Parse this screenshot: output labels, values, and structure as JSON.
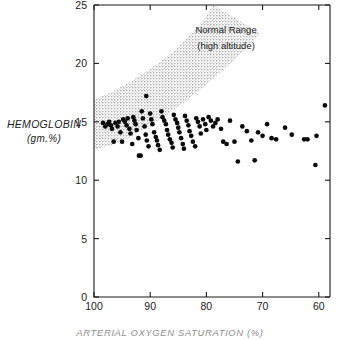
{
  "figure": {
    "title": "",
    "background": "#ffffff",
    "ink_color": "#111111"
  },
  "chart_data": {
    "type": "scatter",
    "title": "",
    "subtitle": "",
    "xlabel": "ARTERIAL OXYGEN SATURATION (%)",
    "ylabel": "HEMOGLOBIN",
    "ylabel_unit": "(gm.%)",
    "xlim": [
      100,
      58
    ],
    "ylim": [
      0,
      25
    ],
    "x_inverted": true,
    "xticks": [
      100,
      90,
      80,
      70,
      60
    ],
    "xticklabels": [
      "100",
      "90",
      "80",
      "70",
      "60"
    ],
    "yticks": [
      0,
      5,
      10,
      15,
      20,
      25
    ],
    "yticklabels": [
      "0",
      "5",
      "10",
      "15",
      "20",
      "25"
    ],
    "grid": false,
    "legend_position": "inside-top-right",
    "annotations": [
      {
        "name": "normal-range-label-line1",
        "text": "Normal Range",
        "x": 76.5,
        "y": 22.6
      },
      {
        "name": "normal-range-label-line2",
        "text": "(high altitude)",
        "x": 76.5,
        "y": 21.2
      }
    ],
    "bands": [
      {
        "name": "Normal Range (high altitude)",
        "fill": "#d2d2d2",
        "style": "stippled",
        "lower": [
          {
            "x": 100.0,
            "y": 12.6
          },
          {
            "x": 97.0,
            "y": 13.0
          },
          {
            "x": 94.0,
            "y": 13.6
          },
          {
            "x": 91.0,
            "y": 14.4
          },
          {
            "x": 88.0,
            "y": 15.3
          },
          {
            "x": 85.0,
            "y": 16.3
          },
          {
            "x": 82.0,
            "y": 17.4
          },
          {
            "x": 79.0,
            "y": 18.6
          },
          {
            "x": 76.0,
            "y": 19.9
          },
          {
            "x": 73.0,
            "y": 21.3
          },
          {
            "x": 70.5,
            "y": 22.6
          }
        ],
        "upper": [
          {
            "x": 100.0,
            "y": 16.9
          },
          {
            "x": 97.0,
            "y": 17.5
          },
          {
            "x": 94.0,
            "y": 18.3
          },
          {
            "x": 91.0,
            "y": 19.2
          },
          {
            "x": 88.0,
            "y": 20.2
          },
          {
            "x": 85.0,
            "y": 21.4
          },
          {
            "x": 82.5,
            "y": 22.6
          },
          {
            "x": 80.5,
            "y": 23.7
          },
          {
            "x": 78.8,
            "y": 25.0
          }
        ]
      }
    ],
    "series": [
      {
        "name": "patients",
        "marker": "filled-circle",
        "color": "#0a0a0a",
        "points": [
          {
            "x": 98.4,
            "y": 14.9
          },
          {
            "x": 98.0,
            "y": 14.6
          },
          {
            "x": 97.6,
            "y": 14.8
          },
          {
            "x": 97.3,
            "y": 15.0
          },
          {
            "x": 97.0,
            "y": 14.7
          },
          {
            "x": 96.8,
            "y": 14.4
          },
          {
            "x": 96.5,
            "y": 13.3
          },
          {
            "x": 96.2,
            "y": 14.9
          },
          {
            "x": 95.8,
            "y": 14.6
          },
          {
            "x": 95.6,
            "y": 15.0
          },
          {
            "x": 95.3,
            "y": 14.1
          },
          {
            "x": 95.0,
            "y": 13.3
          },
          {
            "x": 94.8,
            "y": 15.2
          },
          {
            "x": 94.5,
            "y": 15.0
          },
          {
            "x": 94.2,
            "y": 14.7
          },
          {
            "x": 94.0,
            "y": 15.3
          },
          {
            "x": 93.7,
            "y": 14.4
          },
          {
            "x": 93.5,
            "y": 14.0
          },
          {
            "x": 93.2,
            "y": 13.1
          },
          {
            "x": 93.0,
            "y": 15.4
          },
          {
            "x": 92.8,
            "y": 15.1
          },
          {
            "x": 92.6,
            "y": 14.8
          },
          {
            "x": 92.4,
            "y": 14.3
          },
          {
            "x": 92.1,
            "y": 13.6
          },
          {
            "x": 92.0,
            "y": 12.1
          },
          {
            "x": 91.7,
            "y": 12.1
          },
          {
            "x": 91.5,
            "y": 15.9
          },
          {
            "x": 91.3,
            "y": 15.3
          },
          {
            "x": 91.0,
            "y": 14.6
          },
          {
            "x": 90.8,
            "y": 13.9
          },
          {
            "x": 90.6,
            "y": 13.4
          },
          {
            "x": 90.3,
            "y": 12.9
          },
          {
            "x": 90.0,
            "y": 15.7
          },
          {
            "x": 89.8,
            "y": 15.2
          },
          {
            "x": 89.6,
            "y": 14.8
          },
          {
            "x": 89.3,
            "y": 14.1
          },
          {
            "x": 89.0,
            "y": 13.7
          },
          {
            "x": 88.8,
            "y": 13.4
          },
          {
            "x": 88.6,
            "y": 13.0
          },
          {
            "x": 88.3,
            "y": 12.6
          },
          {
            "x": 88.0,
            "y": 15.9
          },
          {
            "x": 87.8,
            "y": 15.4
          },
          {
            "x": 87.5,
            "y": 15.1
          },
          {
            "x": 87.2,
            "y": 14.8
          },
          {
            "x": 87.0,
            "y": 14.3
          },
          {
            "x": 86.8,
            "y": 13.9
          },
          {
            "x": 86.5,
            "y": 13.5
          },
          {
            "x": 86.2,
            "y": 13.2
          },
          {
            "x": 86.0,
            "y": 12.8
          },
          {
            "x": 85.8,
            "y": 15.6
          },
          {
            "x": 85.5,
            "y": 15.2
          },
          {
            "x": 85.2,
            "y": 14.9
          },
          {
            "x": 85.0,
            "y": 14.5
          },
          {
            "x": 84.8,
            "y": 14.1
          },
          {
            "x": 84.5,
            "y": 13.6
          },
          {
            "x": 84.2,
            "y": 13.1
          },
          {
            "x": 84.0,
            "y": 12.7
          },
          {
            "x": 83.8,
            "y": 15.5
          },
          {
            "x": 83.5,
            "y": 15.1
          },
          {
            "x": 83.2,
            "y": 14.7
          },
          {
            "x": 83.0,
            "y": 14.2
          },
          {
            "x": 82.7,
            "y": 13.8
          },
          {
            "x": 82.4,
            "y": 13.3
          },
          {
            "x": 82.0,
            "y": 12.9
          },
          {
            "x": 81.8,
            "y": 15.3
          },
          {
            "x": 81.5,
            "y": 15.0
          },
          {
            "x": 81.2,
            "y": 14.6
          },
          {
            "x": 81.0,
            "y": 14.0
          },
          {
            "x": 90.7,
            "y": 17.2
          },
          {
            "x": 80.6,
            "y": 15.2
          },
          {
            "x": 80.2,
            "y": 14.8
          },
          {
            "x": 80.0,
            "y": 14.3
          },
          {
            "x": 79.6,
            "y": 15.4
          },
          {
            "x": 79.2,
            "y": 15.1
          },
          {
            "x": 78.8,
            "y": 14.6
          },
          {
            "x": 78.4,
            "y": 14.9
          },
          {
            "x": 78.0,
            "y": 15.2
          },
          {
            "x": 77.4,
            "y": 14.4
          },
          {
            "x": 77.0,
            "y": 13.3
          },
          {
            "x": 76.4,
            "y": 13.1
          },
          {
            "x": 75.8,
            "y": 15.1
          },
          {
            "x": 75.0,
            "y": 13.3
          },
          {
            "x": 74.4,
            "y": 11.6
          },
          {
            "x": 73.6,
            "y": 14.6
          },
          {
            "x": 72.8,
            "y": 14.2
          },
          {
            "x": 72.0,
            "y": 13.4
          },
          {
            "x": 71.4,
            "y": 11.7
          },
          {
            "x": 70.8,
            "y": 14.1
          },
          {
            "x": 70.0,
            "y": 13.8
          },
          {
            "x": 69.2,
            "y": 14.8
          },
          {
            "x": 68.4,
            "y": 13.6
          },
          {
            "x": 67.6,
            "y": 13.5
          },
          {
            "x": 66.0,
            "y": 14.5
          },
          {
            "x": 64.8,
            "y": 13.9
          },
          {
            "x": 62.6,
            "y": 13.5
          },
          {
            "x": 62.0,
            "y": 13.5
          },
          {
            "x": 60.4,
            "y": 13.8
          },
          {
            "x": 60.6,
            "y": 11.3
          },
          {
            "x": 58.9,
            "y": 16.4
          }
        ]
      }
    ]
  }
}
